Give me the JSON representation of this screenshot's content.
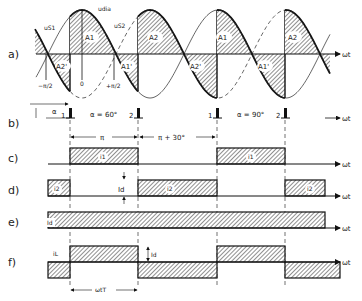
{
  "diagram": {
    "rows": [
      {
        "id": "a",
        "label": "a)"
      },
      {
        "id": "b",
        "label": "b)"
      },
      {
        "id": "c",
        "label": "c)"
      },
      {
        "id": "d",
        "label": "d)"
      },
      {
        "id": "e",
        "label": "e)"
      },
      {
        "id": "f",
        "label": "f)"
      }
    ],
    "axis_label": "ωt",
    "waveform_labels": {
      "u_s1": "uS1",
      "u_s2": "uS2",
      "u_dia": "udia",
      "minus_pi_2": "−π/2",
      "zero": "0",
      "plus_pi_2": "+π/2"
    },
    "areas": [
      "A1",
      "A2",
      "A2'",
      "A1'",
      "A1",
      "A2'",
      "A2",
      "A1'"
    ],
    "pulses": {
      "labels": [
        "1",
        "2",
        "1",
        "2"
      ],
      "alpha_text": "α",
      "alpha_60": "α = 60°",
      "alpha_90": "α = 90°",
      "span_pi": "π",
      "span_pi_30": "π + 30°"
    },
    "currents": {
      "i1": "i1",
      "i2": "i2",
      "Id": "Id",
      "iL": "iL",
      "wT": "ωtT"
    }
  }
}
